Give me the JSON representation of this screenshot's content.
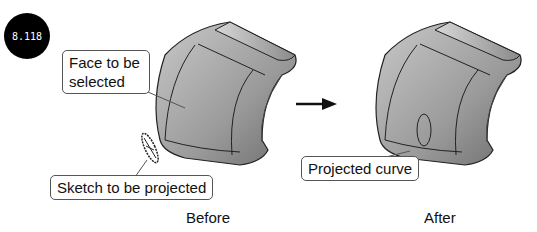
{
  "figure": {
    "badge": "8.118",
    "callouts": {
      "face": [
        "Face to be",
        "selected"
      ],
      "sketch": "Sketch to be projected",
      "projected": "Projected curve"
    },
    "captions": {
      "before": "Before",
      "after": "After"
    },
    "arrow_icon": "right-arrow-icon"
  }
}
